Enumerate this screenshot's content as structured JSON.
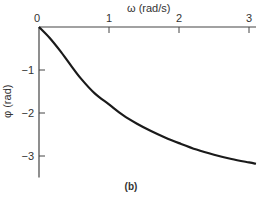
{
  "chart_data": {
    "type": "line",
    "title": "",
    "caption": "(b)",
    "xlabel": "ω (rad/s)",
    "ylabel": "φ (rad)",
    "xlim": [
      0,
      3.1
    ],
    "ylim": [
      -3.5,
      0
    ],
    "x_ticks": [
      "0",
      "1",
      "2",
      "3"
    ],
    "y_ticks": [
      "-1",
      "-2",
      "-3"
    ],
    "x_axis_position": "top",
    "grid": false,
    "legend": null,
    "series": [
      {
        "name": "phase",
        "color": "#1a1a1a",
        "x": [
          0,
          0.15,
          0.3,
          0.45,
          0.6,
          0.8,
          1.0,
          1.2,
          1.4,
          1.6,
          1.8,
          2.0,
          2.25,
          2.5,
          2.75,
          3.0,
          3.1
        ],
        "y": [
          0,
          -0.25,
          -0.55,
          -0.88,
          -1.2,
          -1.55,
          -1.8,
          -2.05,
          -2.25,
          -2.42,
          -2.57,
          -2.7,
          -2.85,
          -2.97,
          -3.07,
          -3.15,
          -3.18
        ]
      }
    ]
  }
}
